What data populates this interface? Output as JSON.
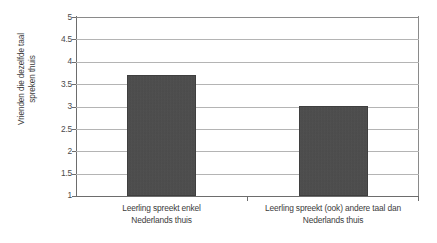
{
  "chart_data": {
    "type": "bar",
    "title": "",
    "xlabel": "",
    "ylabel": "Vrienden die dezelfde taal\nspreken thuis",
    "ylim": [
      1,
      5
    ],
    "grid": true,
    "legend": "none",
    "categories": [
      "Leerling spreekt enkel\nNederlands thuis",
      "Leerling spreekt (ook) andere taal dan\nNederlands thuis"
    ],
    "values": [
      3.7,
      3.0
    ],
    "ytick_labels": [
      "1",
      "1.5",
      "2",
      "2.5",
      "3",
      "3.5",
      "4",
      "4.5",
      "5"
    ],
    "ytick_values": [
      1,
      1.5,
      2,
      2.5,
      3,
      3.5,
      4,
      4.5,
      5
    ],
    "colors": {
      "bar": "#4a4a4a",
      "gridline": "#b4b4b4",
      "axis": "#6d6d6d",
      "text": "#3c3c3c",
      "background": "#ffffff"
    }
  }
}
